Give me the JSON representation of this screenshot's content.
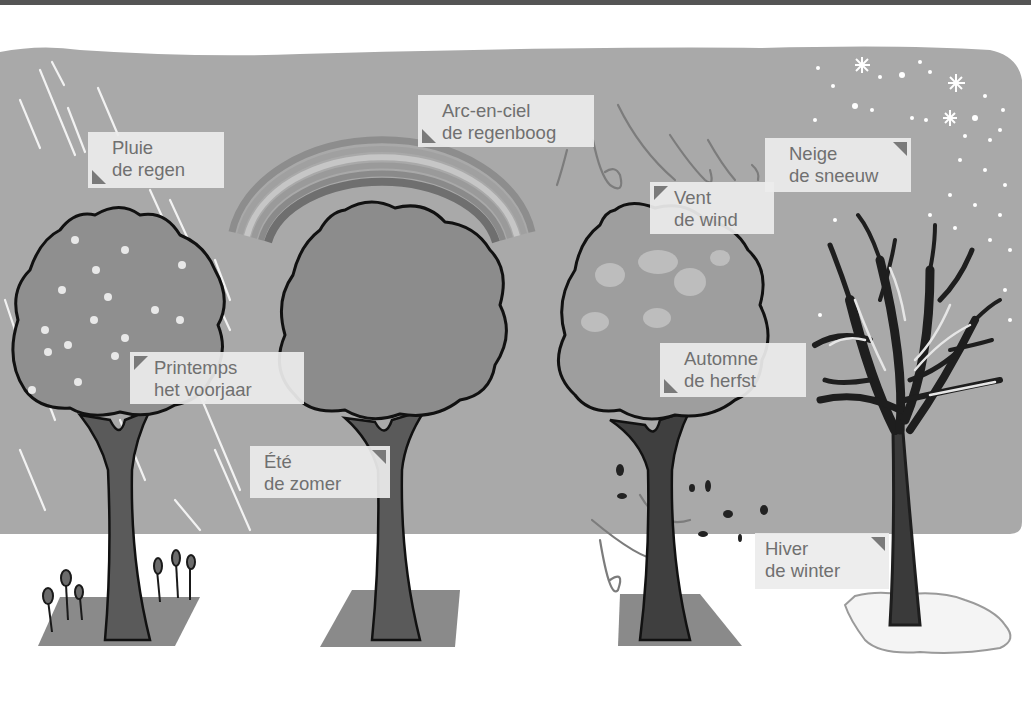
{
  "colors": {
    "panel_bg": "#a9a9a9",
    "ground": "#ffffff",
    "label_bg": "#ececec",
    "label_text": "#707070",
    "corner_marker": "#7a7a7a",
    "foliage_spring": "#8f8f8f",
    "foliage_summer": "#8c8c8c",
    "foliage_autumn": "#9e9e9e",
    "trunk": "#4a4a4a",
    "shadow": "#8a8a8a"
  },
  "labels": {
    "rain": {
      "fr": "Pluie",
      "nl": "de regen"
    },
    "rainbow": {
      "fr": "Arc-en-ciel",
      "nl": "de regenboog"
    },
    "snow": {
      "fr": "Neige",
      "nl": "de sneeuw"
    },
    "wind": {
      "fr": "Vent",
      "nl": "de wind"
    },
    "spring": {
      "fr": "Printemps",
      "nl": "het voorjaar"
    },
    "summer": {
      "fr": "Été",
      "nl": "de zomer"
    },
    "autumn": {
      "fr": "Automne",
      "nl": "de herfst"
    },
    "winter": {
      "fr": "Hiver",
      "nl": "de winter"
    }
  },
  "illustrations": [
    {
      "name": "spring-tree",
      "season": "spring",
      "features": [
        "blossoms",
        "rain",
        "tulips"
      ]
    },
    {
      "name": "summer-tree",
      "season": "summer",
      "features": [
        "rainbow"
      ]
    },
    {
      "name": "autumn-tree",
      "season": "autumn",
      "features": [
        "wind",
        "falling-leaves"
      ]
    },
    {
      "name": "winter-tree",
      "season": "winter",
      "features": [
        "bare-branches",
        "snowflakes",
        "snow-pile"
      ]
    }
  ]
}
